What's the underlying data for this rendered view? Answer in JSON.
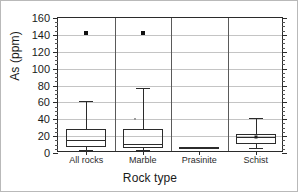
{
  "chart_data": {
    "type": "box",
    "title": "",
    "xlabel": "Rock type",
    "ylabel": "As (ppm)",
    "categories": [
      "All rocks",
      "Marble",
      "Prasinite",
      "Schist"
    ],
    "ylim": [
      0,
      160
    ],
    "yticks": [
      0,
      20,
      40,
      60,
      80,
      100,
      120,
      140,
      160
    ],
    "ytick_labels": [
      "0",
      "20",
      "40",
      "60",
      "80",
      "100",
      "120",
      "140",
      "160"
    ],
    "y_minor_tick_step": 5,
    "grid": "horizontal",
    "legend": "none",
    "boxes": [
      {
        "category": "All rocks",
        "whisker_low": 3,
        "q1": 7,
        "median": 15,
        "q3": 28,
        "whisker_high": 62,
        "outliers": [
          142
        ],
        "mean": null
      },
      {
        "category": "Marble",
        "whisker_low": 3,
        "q1": 6,
        "median": 11,
        "q3": 29,
        "whisker_high": 77,
        "outliers": [
          142
        ],
        "extra_points": [
          40
        ],
        "mean": null
      },
      {
        "category": "Prasinite",
        "whisker_low": 6,
        "q1": 6,
        "median": 7,
        "q3": 7,
        "whisker_high": 7,
        "outliers": [],
        "mean": null
      },
      {
        "category": "Schist",
        "whisker_low": 6,
        "q1": 11,
        "median": 19,
        "q3": 23,
        "whisker_high": 41,
        "outliers": [],
        "mean": 19
      }
    ]
  },
  "colors": {
    "line": "#2b2b2b",
    "grid": "#c4c4c4",
    "marker": "#111111",
    "background": "#ffffff",
    "frame": "#b9b9b9"
  }
}
